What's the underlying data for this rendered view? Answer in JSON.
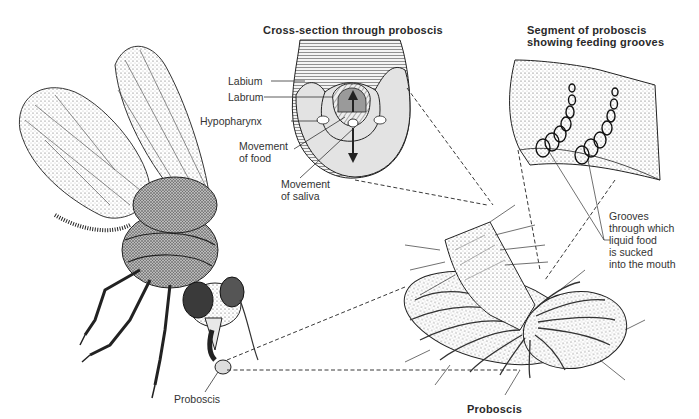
{
  "figure": {
    "panels": {
      "cross_section": {
        "title": "Cross-section through proboscis",
        "labels": {
          "labium": "Labium",
          "labrum": "Labrum",
          "hypopharynx": "Hypopharynx",
          "movement_food_1": "Movement",
          "movement_food_2": "of food",
          "movement_saliva_1": "Movement",
          "movement_saliva_2": "of saliva"
        }
      },
      "segment": {
        "title_line1": "Segment of proboscis",
        "title_line2": "showing feeding grooves",
        "grooves_label": [
          "Grooves",
          "through which",
          "liquid food",
          "is sucked",
          "into the mouth"
        ]
      },
      "fly": {
        "proboscis_label": "Proboscis"
      },
      "proboscis_detail": {
        "title": "Proboscis"
      }
    },
    "colors": {
      "ink": "#2a2a2a",
      "shade": "#d9d9d9",
      "light_shade": "#ececec",
      "background": "#ffffff"
    }
  }
}
